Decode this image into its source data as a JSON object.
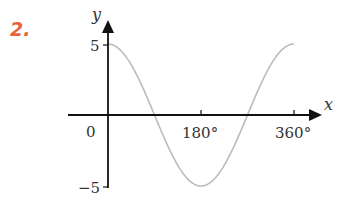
{
  "question_number": "2.",
  "colors": {
    "question_number": "#e8623a",
    "axes": "#111111",
    "curve": "#bbbbbb",
    "text": "#333333"
  },
  "chart_data": {
    "type": "line",
    "title": "",
    "xlabel": "x",
    "ylabel": "y",
    "function": "y = 5cos(x)",
    "x": [
      0,
      45,
      90,
      135,
      180,
      225,
      270,
      315,
      360
    ],
    "series": [
      {
        "name": "curve",
        "values": [
          5,
          3.54,
          0,
          -3.54,
          -5,
          -3.54,
          0,
          3.54,
          5
        ]
      }
    ],
    "xticks": [
      "0",
      "180°",
      "360°"
    ],
    "yticks": [
      "5",
      "-5"
    ],
    "xlim": [
      0,
      360
    ],
    "ylim": [
      -5,
      5
    ],
    "grid": false,
    "legend": null
  },
  "labels": {
    "x_axis": "x",
    "y_axis": "y",
    "origin": "0",
    "x_tick_180": "180°",
    "x_tick_360": "360°",
    "y_tick_pos": "5",
    "y_tick_neg": "−5"
  }
}
